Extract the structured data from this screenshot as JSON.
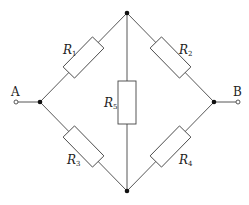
{
  "diagram": {
    "type": "wheatstone-bridge-circuit",
    "terminals": [
      {
        "label": "A",
        "side": "left"
      },
      {
        "label": "B",
        "side": "right"
      }
    ],
    "resistors": [
      {
        "id": "R1",
        "symbol": "R",
        "subscript": "1",
        "branch": "A-top"
      },
      {
        "id": "R2",
        "symbol": "R",
        "subscript": "2",
        "branch": "top-B"
      },
      {
        "id": "R3",
        "symbol": "R",
        "subscript": "3",
        "branch": "A-bottom"
      },
      {
        "id": "R4",
        "symbol": "R",
        "subscript": "4",
        "branch": "bottom-B"
      },
      {
        "id": "R5",
        "symbol": "R",
        "subscript": "5",
        "branch": "top-bottom"
      }
    ],
    "colors": {
      "line": "#444444",
      "node": "#111111",
      "background": "#ffffff"
    }
  }
}
